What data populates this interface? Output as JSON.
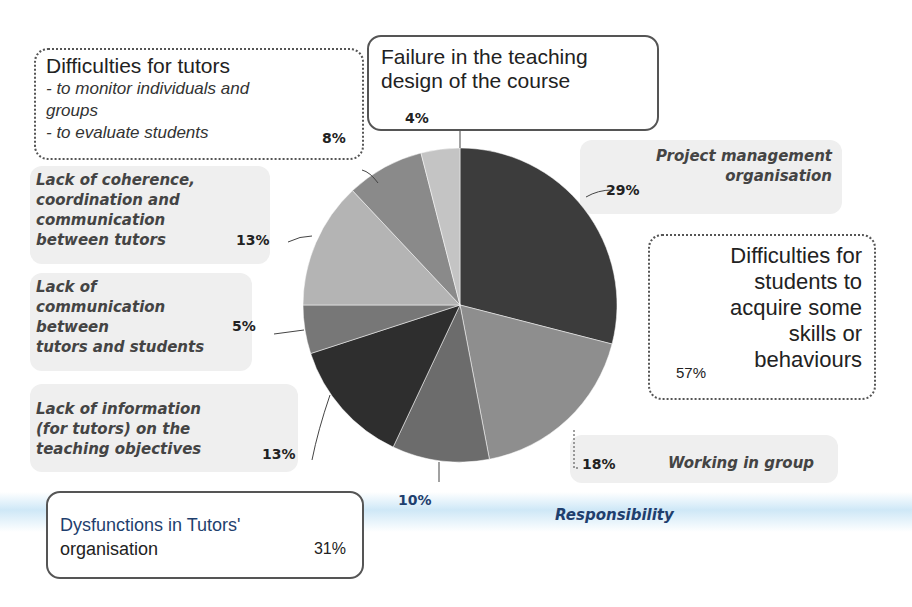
{
  "chart_data": {
    "type": "pie",
    "title": "",
    "start_angle": "12 o'clock, clockwise",
    "slices": [
      {
        "label": "Project management organisation",
        "value": 29,
        "color": "#3c3c3c",
        "group": "Dysfunctions in Tutors' organisation"
      },
      {
        "label": "Working in group",
        "value": 18,
        "color": "#8e8e8e",
        "group": "Difficulties for students to acquire some skills or behaviours"
      },
      {
        "label": "Responsibility",
        "value": 10,
        "color": "#6c6c6c",
        "group": "Difficulties for students to acquire some skills or behaviours"
      },
      {
        "label": "Lack of information (for tutors) on the teaching objectives",
        "value": 13,
        "color": "#2e2e2e",
        "group": "Difficulties for students to acquire some skills or behaviours"
      },
      {
        "label": "Lack of communication between tutors and students",
        "value": 5,
        "color": "#777777",
        "group": "Dysfunctions in Tutors' organisation"
      },
      {
        "label": "Lack of coherence, coordination and communication between tutors",
        "value": 13,
        "color": "#b4b4b4",
        "group": "Dysfunctions in Tutors' organisation"
      },
      {
        "label": "Difficulties for tutors - to monitor individuals and groups - to evaluate students",
        "value": 8,
        "color": "#8a8a8a",
        "group": "Difficulties for tutors"
      },
      {
        "label": "Failure in the teaching design of the course",
        "value": 4,
        "color": "#c4c4c4",
        "group": "Failure in the teaching design of the course"
      }
    ],
    "groups": [
      {
        "label": "Dysfunctions in Tutors' organisation",
        "value": 31
      },
      {
        "label": "Difficulties for students to acquire some skills or behaviours",
        "value": 57
      },
      {
        "label": "Difficulties for tutors",
        "value": 8
      },
      {
        "label": "Failure in the teaching design of the course",
        "value": 4
      }
    ],
    "legend": "none (callout labels)",
    "grid": false
  },
  "labels": {
    "tutors_difficulties": {
      "title": "Difficulties for tutors",
      "line1": "- to monitor individuals  and",
      "line2": "groups",
      "line3": "- to evaluate  students",
      "pct": "8%"
    },
    "teaching_design": {
      "line1": "Failure in the teaching",
      "line2": "design of the course",
      "pct": "4%"
    },
    "project_mgmt": {
      "line1": "Project management",
      "line2": "organisation",
      "pct": "29%"
    },
    "students_difficulties": {
      "line1": "Difficulties for",
      "line2": "students to",
      "line3": "acquire some",
      "line4": "skills or",
      "line5": "behaviours",
      "pct": "57%"
    },
    "coherence": {
      "line1": "Lack of coherence,",
      "line2": "coordination and",
      "line3": "communication",
      "line4": "between tutors",
      "pct": "13%"
    },
    "comm_tutors_students": {
      "line1": "Lack of",
      "line2": "communication",
      "line3": "between",
      "line4": "tutors and students",
      "pct": "5%"
    },
    "information": {
      "line1": "Lack of information",
      "line2": "(for tutors) on the",
      "line3": "teaching objectives",
      "pct": "13%"
    },
    "working_group": {
      "label": "Working in group",
      "pct": "18%"
    },
    "responsibility": {
      "label": "Responsibility",
      "pct": "10%"
    },
    "tutors_org": {
      "line1": "Dysfunctions in Tutors'",
      "line2": "organisation",
      "pct": "31%"
    }
  },
  "colors": {
    "outline": "#555555",
    "grey_box": "#efefef",
    "blue_text": "#1f3f6e",
    "blue_band": "#bee0f4"
  }
}
